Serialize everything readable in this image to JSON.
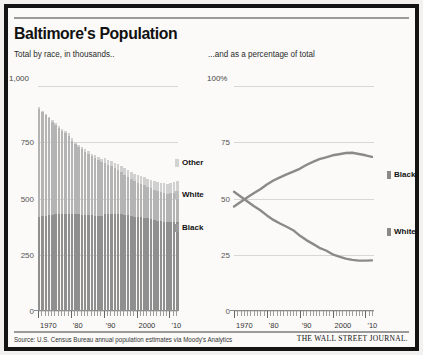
{
  "header": {
    "title": "Baltimore's Population",
    "subtitle_left": "Total by race, in thousands..",
    "subtitle_right": "...and as a percentage of total"
  },
  "footer": {
    "source": "Source: U.S. Census Bureau annual population estimates via Moody's Analytics",
    "brand": "THE WALL STREET JOURNAL."
  },
  "legend_left": [
    {
      "label": "Other",
      "color": "#d2d2d2"
    },
    {
      "label": "White",
      "color": "#bdbdbd"
    },
    {
      "label": "Black",
      "color": "#9a9a9a"
    }
  ],
  "legend_right": [
    {
      "label": "Black",
      "color": "#8a8a8a"
    },
    {
      "label": "White",
      "color": "#8a8a8a"
    }
  ],
  "chart_data": [
    {
      "type": "bar",
      "title": "Baltimore's Population",
      "subtitle": "Total by race, in thousands..",
      "stacked": true,
      "xlabel": "",
      "ylabel": "thousands",
      "ylim": [
        0,
        1000
      ],
      "yticks": [
        0,
        250,
        500,
        750,
        1000
      ],
      "ytick_labels": [
        "0",
        "250",
        "500",
        "750",
        "1,000"
      ],
      "grid": true,
      "legend_position": "right",
      "x": [
        1970,
        1971,
        1972,
        1973,
        1974,
        1975,
        1976,
        1977,
        1978,
        1979,
        1980,
        1981,
        1982,
        1983,
        1984,
        1985,
        1986,
        1987,
        1988,
        1989,
        1990,
        1991,
        1992,
        1993,
        1994,
        1995,
        1996,
        1997,
        1998,
        1999,
        2000,
        2001,
        2002,
        2003,
        2004,
        2005,
        2006,
        2007,
        2008,
        2009,
        2010,
        2011,
        2012
      ],
      "xtick_labels": [
        "1970",
        "'80",
        "'90",
        "2000",
        "'10"
      ],
      "series": [
        {
          "name": "Black",
          "color": "#8f8f8f",
          "values": [
            420,
            422,
            424,
            426,
            428,
            429,
            430,
            431,
            432,
            433,
            431,
            430,
            429,
            428,
            427,
            426,
            425,
            424,
            424,
            424,
            430,
            432,
            433,
            433,
            432,
            430,
            428,
            425,
            422,
            419,
            418,
            416,
            414,
            412,
            410,
            406,
            402,
            399,
            396,
            394,
            395,
            395,
            396
          ]
        },
        {
          "name": "White",
          "color": "#b4b4b4",
          "values": [
            480,
            462,
            446,
            430,
            414,
            398,
            384,
            370,
            358,
            346,
            326,
            312,
            300,
            290,
            280,
            270,
            262,
            254,
            246,
            238,
            228,
            218,
            210,
            202,
            194,
            186,
            178,
            172,
            166,
            160,
            152,
            148,
            144,
            140,
            136,
            132,
            130,
            128,
            127,
            126,
            128,
            129,
            130
          ]
        },
        {
          "name": "Other",
          "color": "#d0d0d0",
          "values": [
            5,
            6,
            6,
            7,
            7,
            8,
            8,
            9,
            9,
            10,
            10,
            11,
            11,
            12,
            12,
            13,
            13,
            14,
            15,
            15,
            22,
            23,
            24,
            25,
            26,
            27,
            28,
            29,
            30,
            31,
            34,
            35,
            36,
            37,
            38,
            39,
            40,
            42,
            44,
            46,
            48,
            50,
            52
          ]
        }
      ],
      "totals": [
        905,
        890,
        876,
        863,
        849,
        835,
        822,
        810,
        799,
        789,
        767,
        753,
        740,
        730,
        719,
        709,
        700,
        692,
        685,
        677,
        680,
        673,
        667,
        660,
        652,
        643,
        634,
        626,
        618,
        610,
        604,
        599,
        594,
        589,
        584,
        577,
        572,
        569,
        567,
        566,
        571,
        574,
        578
      ]
    },
    {
      "type": "line",
      "title": "",
      "subtitle": "...and as a percentage of total",
      "xlabel": "",
      "ylabel": "percent of total",
      "ylim": [
        0,
        100
      ],
      "yticks": [
        0,
        25,
        50,
        75,
        100
      ],
      "ytick_labels": [
        "0",
        "25",
        "50",
        "75",
        "100%"
      ],
      "grid": true,
      "legend_position": "right",
      "x": [
        1970,
        1972,
        1974,
        1976,
        1978,
        1980,
        1982,
        1984,
        1986,
        1988,
        1990,
        1992,
        1994,
        1996,
        1998,
        2000,
        2002,
        2004,
        2006,
        2008,
        2010,
        2012
      ],
      "xtick_labels": [
        "1970",
        "'80",
        "'90",
        "2000",
        "'10"
      ],
      "series": [
        {
          "name": "Black",
          "color": "#8a8a8a",
          "values": [
            46.4,
            48.4,
            50.4,
            52.3,
            54.1,
            56.2,
            58.0,
            59.4,
            60.7,
            61.9,
            63.2,
            64.9,
            66.3,
            67.5,
            68.3,
            69.2,
            69.7,
            70.2,
            70.3,
            69.8,
            69.2,
            68.5
          ]
        },
        {
          "name": "White",
          "color": "#8a8a8a",
          "values": [
            53.0,
            50.9,
            48.8,
            46.7,
            44.8,
            42.5,
            40.5,
            38.9,
            37.4,
            35.9,
            33.5,
            31.5,
            29.8,
            28.1,
            26.9,
            25.2,
            24.2,
            23.3,
            22.7,
            22.4,
            22.4,
            22.5
          ]
        }
      ]
    }
  ]
}
